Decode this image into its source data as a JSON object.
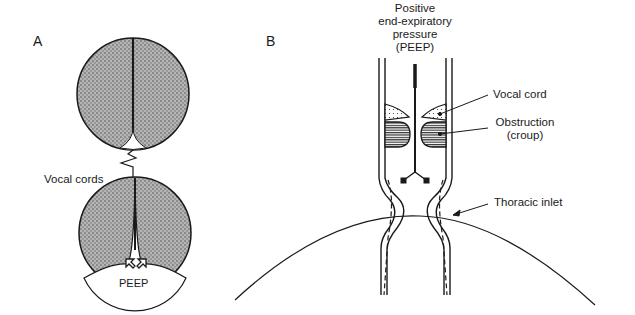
{
  "panels": {
    "a": {
      "letter": "A",
      "labels": {
        "vocal_cords": "Vocal cords",
        "peep": "PEEP"
      }
    },
    "b": {
      "letter": "B",
      "title_lines": [
        "Positive",
        "end-expiratory",
        "pressure",
        "(PEEP)"
      ],
      "labels": {
        "vocal_cord": "Vocal cord",
        "obstruction_line1": "Obstruction",
        "obstruction_line2": "(croup)",
        "thoracic_inlet": "Thoracic inlet"
      }
    }
  },
  "colors": {
    "ink": "#1a1a1a",
    "lung_fill": "#9a9a9a",
    "background": "#ffffff"
  }
}
